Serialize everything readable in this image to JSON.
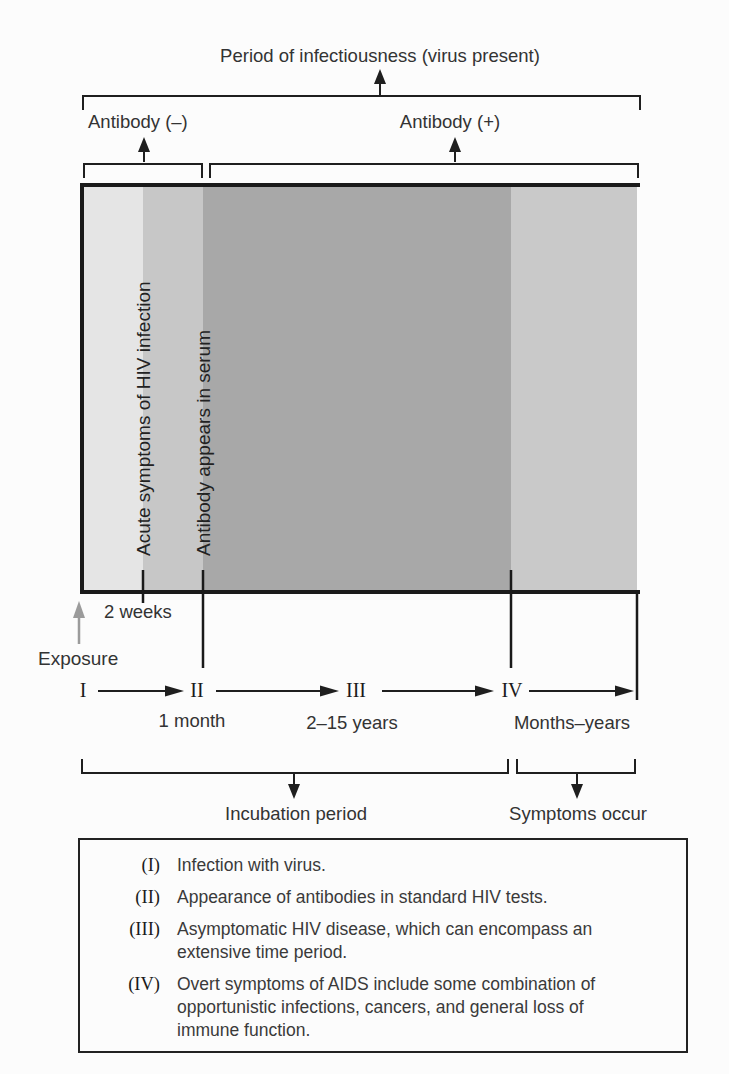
{
  "header": {
    "title": "Period of infectiousness (virus present)",
    "antibody_negative": "Antibody (–)",
    "antibody_positive": "Antibody (+)"
  },
  "phase_chart": {
    "band_labels": {
      "acute": "Acute symptoms of HIV infection",
      "antibody": "Antibody appears in serum"
    },
    "band_colors": [
      "#e5e5e5",
      "#c7c7c7",
      "#a8a8a8",
      "#c9c9c9"
    ]
  },
  "timeline": {
    "exposure_label": "Exposure",
    "two_weeks_label": "2 weeks",
    "stages": [
      "I",
      "II",
      "III",
      "IV"
    ],
    "durations": {
      "stage2": "1 month",
      "stage3": "2–15 years",
      "stage4": "Months–years"
    },
    "incubation_label": "Incubation period",
    "symptoms_label": "Symptoms occur"
  },
  "legend": {
    "items": [
      {
        "numeral": "(I)",
        "text": "Infection with virus."
      },
      {
        "numeral": "(II)",
        "text": "Appearance of antibodies in standard HIV tests."
      },
      {
        "numeral": "(III)",
        "text": "Asymptomatic HIV disease, which can encompass an\nextensive time period."
      },
      {
        "numeral": "(IV)",
        "text": "Overt symptoms of AIDS include some combination of\nopportunistic infections, cancers, and general loss of\nimmune function."
      }
    ]
  }
}
